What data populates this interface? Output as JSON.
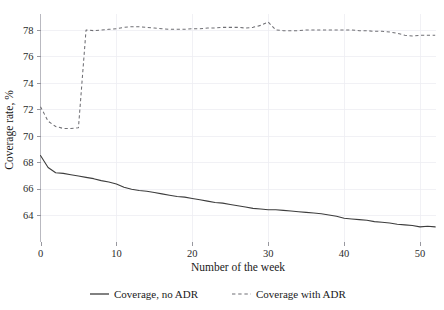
{
  "chart_data": {
    "type": "line",
    "title": "",
    "xlabel": "Number of the week",
    "ylabel": "Coverage rate, %",
    "xlim": [
      0,
      52
    ],
    "ylim": [
      62.8,
      79.2
    ],
    "xticks": [
      0,
      10,
      20,
      30,
      40,
      50
    ],
    "yticks": [
      64,
      66,
      68,
      70,
      72,
      74,
      76,
      78
    ],
    "grid": true,
    "grid_axes": "both",
    "legend_position": "bottom",
    "x": [
      0,
      1,
      2,
      3,
      4,
      5,
      6,
      7,
      8,
      9,
      10,
      11,
      12,
      13,
      14,
      15,
      16,
      17,
      18,
      19,
      20,
      21,
      22,
      23,
      24,
      25,
      26,
      27,
      28,
      29,
      30,
      31,
      32,
      33,
      34,
      35,
      36,
      37,
      38,
      39,
      40,
      41,
      42,
      43,
      44,
      45,
      46,
      47,
      48,
      49,
      50,
      51,
      52
    ],
    "series": [
      {
        "name": "Coverage, no ADR",
        "style": "solid",
        "color": "#3d3d3d",
        "values": [
          68.5,
          67.6,
          67.2,
          67.15,
          67.05,
          66.95,
          66.85,
          66.75,
          66.6,
          66.5,
          66.35,
          66.1,
          65.95,
          65.85,
          65.8,
          65.7,
          65.6,
          65.5,
          65.4,
          65.35,
          65.25,
          65.15,
          65.05,
          64.95,
          64.9,
          64.8,
          64.7,
          64.6,
          64.5,
          64.45,
          64.4,
          64.4,
          64.35,
          64.3,
          64.25,
          64.2,
          64.15,
          64.1,
          64.0,
          63.9,
          63.75,
          63.7,
          63.65,
          63.6,
          63.5,
          63.45,
          63.4,
          63.3,
          63.25,
          63.2,
          63.1,
          63.15,
          63.1
        ]
      },
      {
        "name": "Coverage with ADR",
        "style": "dashed",
        "color": "#6f6f74",
        "values": [
          72.2,
          71.1,
          70.7,
          70.55,
          70.55,
          70.6,
          78.0,
          77.95,
          78.0,
          78.05,
          78.1,
          78.2,
          78.25,
          78.25,
          78.2,
          78.15,
          78.1,
          78.05,
          78.05,
          78.05,
          78.1,
          78.1,
          78.15,
          78.15,
          78.2,
          78.2,
          78.2,
          78.15,
          78.2,
          78.35,
          78.6,
          78.0,
          77.95,
          77.95,
          77.95,
          78.0,
          78.0,
          78.0,
          78.0,
          78.0,
          78.0,
          78.0,
          77.95,
          77.95,
          77.9,
          77.9,
          77.85,
          77.75,
          77.6,
          77.55,
          77.6,
          77.6,
          77.6
        ]
      }
    ]
  },
  "legend": {
    "items": [
      {
        "label": "Coverage, no ADR",
        "style": "solid"
      },
      {
        "label": "Coverage with ADR",
        "style": "dashed"
      }
    ]
  }
}
